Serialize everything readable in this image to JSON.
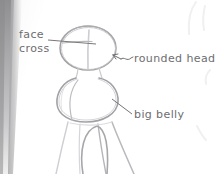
{
  "scene": {
    "kind": "pencil-sketch-photo",
    "medium": "graphite pencil on sketchbook paper",
    "subject": "construction sketch of a cartoon figure: oval head, large belly, flaring legs",
    "paper_color": "#fdfdfd",
    "pencil_color": "#9a9a9e",
    "pencil_color_light": "#cfcfd2",
    "ink_color": "#6d6d70",
    "gutter_shadow_color": "#a9a9ab"
  },
  "annotations": [
    {
      "id": "face-cross",
      "line1": "face",
      "line2": "cross",
      "leader": "horizontal-line-to-head-brow",
      "points_at": "face-cross-guidelines"
    },
    {
      "id": "rounded-head",
      "text": "rounded head",
      "leader": "squiggle-arrow-to-head-edge",
      "points_at": "head-oval"
    },
    {
      "id": "big-belly",
      "text": "big belly",
      "leader": "diagonal-line-to-belly-edge",
      "points_at": "belly-mass"
    }
  ],
  "figure_parts": [
    {
      "name": "head-oval",
      "note": "rounded head"
    },
    {
      "name": "face-cross-vertical",
      "note": "face cross"
    },
    {
      "name": "face-cross-horizontal",
      "note": "face cross"
    },
    {
      "name": "belly-mass",
      "note": "big belly"
    },
    {
      "name": "belly-inner-contour",
      "note": "big belly"
    },
    {
      "name": "legs-skirt",
      "note": "flaring legs"
    },
    {
      "name": "leg-gap-arch",
      "note": "flaring legs"
    },
    {
      "name": "neighbor-sketch-bleed",
      "note": "faint marks at right edge"
    }
  ]
}
